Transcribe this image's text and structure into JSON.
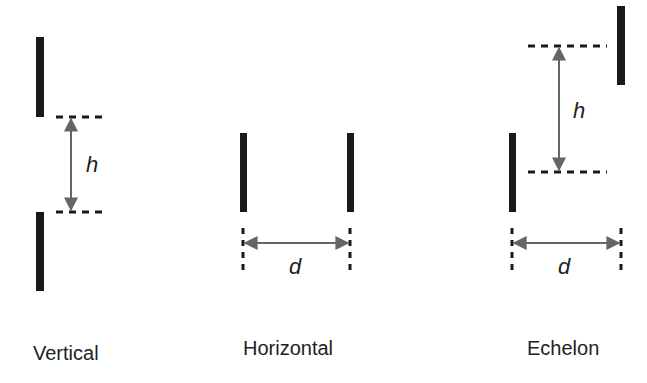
{
  "diagram": {
    "colors": {
      "bar": "#1a1a1a",
      "dash": "#1a1a1a",
      "arrow": "#666666",
      "text": "#222222",
      "background": "#ffffff"
    },
    "panels": [
      {
        "id": "vertical",
        "label": "Vertical",
        "dimension_symbol": "h",
        "dimension_meaning": "vertical separation"
      },
      {
        "id": "horizontal",
        "label": "Horizontal",
        "dimension_symbol": "d",
        "dimension_meaning": "horizontal separation"
      },
      {
        "id": "echelon",
        "label": "Echelon",
        "dimension_symbols": [
          "h",
          "d"
        ],
        "h_symbol": "h",
        "d_symbol": "d"
      }
    ]
  }
}
